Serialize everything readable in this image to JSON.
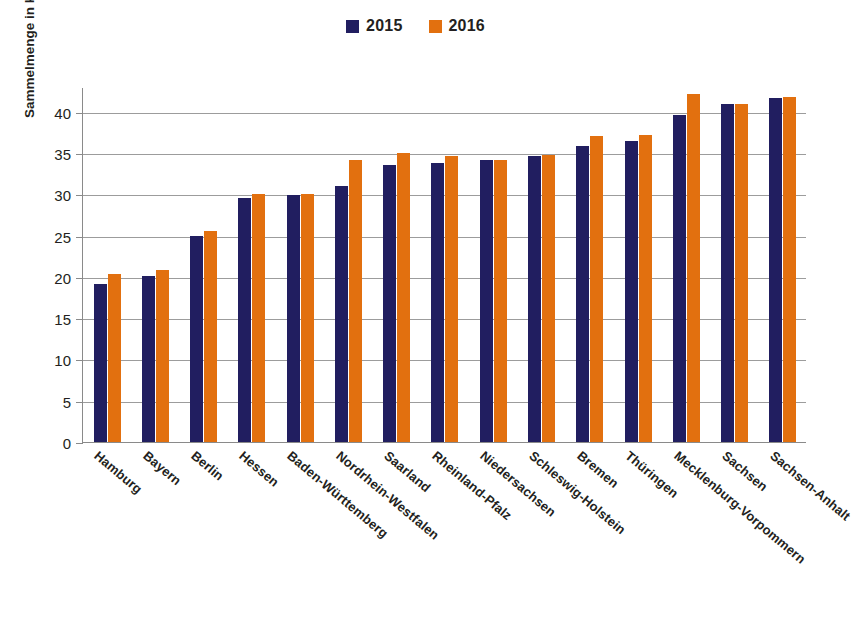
{
  "chart_data": {
    "type": "bar",
    "title": "",
    "xlabel": "",
    "ylabel": "Sammelmenge in kg/E*a",
    "ylim": [
      0,
      43
    ],
    "ytick_step": 5,
    "yticks": [
      "40",
      "35",
      "30",
      "25",
      "20",
      "15",
      "10",
      "5",
      "0"
    ],
    "ytick_values": [
      40,
      35,
      30,
      25,
      20,
      15,
      10,
      5,
      0
    ],
    "grid": true,
    "legend_position": "top-center",
    "categories": [
      "Hamburg",
      "Bayern",
      "Berlin",
      "Hessen",
      "Baden-Württemberg",
      "Nordrhein-Westfalen",
      "Saarland",
      "Rheinland-Pfalz",
      "Niedersachsen",
      "Schleswig-Holstein",
      "Bremen",
      "Thüringen",
      "Mecklenburg-Vorpommern",
      "Sachsen",
      "Sachsen-Anhalt"
    ],
    "series": [
      {
        "name": "2015",
        "color": "#211e60",
        "values": [
          19.1,
          20.1,
          24.9,
          29.5,
          29.9,
          31.0,
          33.5,
          33.8,
          34.1,
          34.7,
          35.9,
          36.5,
          39.6,
          41.0,
          41.7
        ]
      },
      {
        "name": "2016",
        "color": "#e2700f",
        "values": [
          20.3,
          20.8,
          25.6,
          30.0,
          30.1,
          34.1,
          35.0,
          34.6,
          34.1,
          34.8,
          37.1,
          37.2,
          42.1,
          41.0,
          41.8
        ]
      }
    ]
  },
  "legend": {
    "items": [
      {
        "label": "2015",
        "color": "#211e60"
      },
      {
        "label": "2016",
        "color": "#e2700f"
      }
    ]
  },
  "colors": {
    "series_2015": "#211e60",
    "series_2016": "#e2700f",
    "grid": "#9c9c9c",
    "axis": "#8a8a8a",
    "text": "#231f20",
    "background": "#ffffff"
  }
}
